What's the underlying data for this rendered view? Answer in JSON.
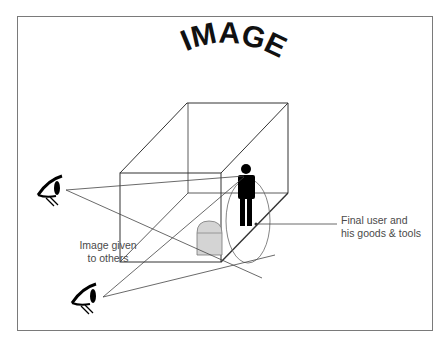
{
  "title": "IMAGE",
  "labels": {
    "image_given_line1": "Image given",
    "image_given_line2": "to others",
    "final_user_line1": "Final user and",
    "final_user_line2": "his goods & tools"
  },
  "colors": {
    "line": "#333333",
    "border": "#7a7a7a",
    "text": "#4a4a4a",
    "dome": "#d4d4d4"
  }
}
